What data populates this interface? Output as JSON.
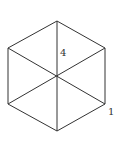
{
  "diagram": {
    "type": "hexagon-with-diagonals",
    "stroke_color": "#333333",
    "background": "#ffffff",
    "vertices": {
      "top": [
        57,
        21
      ],
      "upper_right": [
        105,
        48
      ],
      "lower_right": [
        105,
        104
      ],
      "bottom": [
        57,
        131
      ],
      "lower_left": [
        8,
        104
      ],
      "upper_left": [
        8,
        48
      ],
      "center": [
        57,
        76
      ]
    },
    "labels": {
      "top_segment": "4",
      "lower_right_vertex": "1"
    }
  }
}
